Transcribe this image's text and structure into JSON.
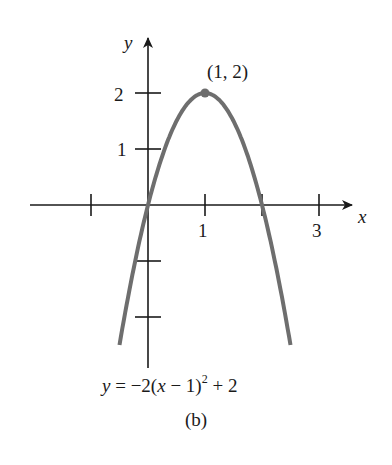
{
  "chart_data": {
    "type": "line",
    "title": "",
    "caption": "(b)",
    "equation": {
      "lhs": "y",
      "rhs_prefix": "= −2(",
      "var": "x",
      "rhs_mid": " − 1)",
      "exponent": "2",
      "rhs_suffix": " + 2"
    },
    "xlabel": "x",
    "ylabel": "y",
    "xlim": [
      -1.5,
      3.9
    ],
    "ylim": [
      -3,
      3
    ],
    "x_ticks": [
      -1,
      0,
      1,
      2,
      3
    ],
    "x_tick_labels": {
      "1": "1",
      "3": "3"
    },
    "y_ticks": [
      -2,
      -1,
      1,
      2
    ],
    "y_tick_labels": {
      "1": "1",
      "2": "2"
    },
    "grid": false,
    "series": [
      {
        "name": "y = -2(x-1)^2 + 2",
        "color": "#6e6e6e",
        "x": [
          -0.5,
          -0.25,
          0,
          0.25,
          0.5,
          0.75,
          1,
          1.25,
          1.5,
          1.75,
          2,
          2.25,
          2.5
        ],
        "y": [
          -2.5,
          -1.125,
          0,
          0.875,
          1.5,
          1.875,
          2,
          1.875,
          1.5,
          0.875,
          0,
          -1.125,
          -2.5
        ]
      }
    ],
    "annotations": [
      {
        "point": [
          1,
          2
        ],
        "label": "(1, 2)",
        "marker": "dot"
      }
    ]
  },
  "labels": {
    "x_axis": "x",
    "y_axis": "y",
    "tick_x_1": "1",
    "tick_x_3": "3",
    "tick_y_1": "1",
    "tick_y_2": "2",
    "vertex": "(1, 2)",
    "caption": "(b)"
  },
  "colors": {
    "curve": "#6e6e6e",
    "axes": "#1a1a1a"
  }
}
